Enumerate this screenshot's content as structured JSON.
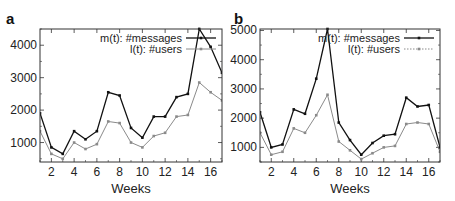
{
  "chart_data": [
    {
      "type": "line",
      "panel_label": "a",
      "title": "",
      "xlabel": "Weeks",
      "ylabel": "",
      "x": [
        1,
        2,
        3,
        4,
        5,
        6,
        7,
        8,
        9,
        10,
        11,
        12,
        13,
        14,
        15,
        16,
        17
      ],
      "xticks": [
        2,
        4,
        6,
        8,
        10,
        12,
        14,
        16
      ],
      "yticks": [
        1000,
        2000,
        3000,
        4000
      ],
      "xlim": [
        1,
        17
      ],
      "ylim": [
        400,
        4500
      ],
      "grid": false,
      "legend_position": "upper right",
      "series": [
        {
          "name": "m(t): #messages",
          "color": "#111111",
          "style": "solid",
          "values": [
            1900,
            850,
            650,
            1350,
            1100,
            1350,
            2550,
            2450,
            1450,
            1150,
            1800,
            1800,
            2400,
            2500,
            4500,
            3950,
            3150
          ]
        },
        {
          "name": "l(t): #users",
          "color": "#8a8a8a",
          "style": "solid",
          "values": [
            1350,
            650,
            500,
            1000,
            800,
            950,
            1650,
            1600,
            1000,
            850,
            1200,
            1300,
            1800,
            1850,
            2850,
            2550,
            2300
          ]
        }
      ]
    },
    {
      "type": "line",
      "panel_label": "b",
      "title": "",
      "xlabel": "Weeks",
      "ylabel": "",
      "x": [
        1,
        2,
        3,
        4,
        5,
        6,
        7,
        8,
        9,
        10,
        11,
        12,
        13,
        14,
        15,
        16,
        17
      ],
      "xticks": [
        2,
        4,
        6,
        8,
        10,
        12,
        14,
        16
      ],
      "yticks": [
        1000,
        2000,
        3000,
        4000,
        5000
      ],
      "xlim": [
        1,
        17
      ],
      "ylim": [
        500,
        5050
      ],
      "grid": false,
      "legend_position": "upper right",
      "series": [
        {
          "name": "m(t): #messages",
          "color": "#111111",
          "style": "solid",
          "values": [
            2200,
            1000,
            1100,
            2300,
            2150,
            3350,
            5050,
            1850,
            1250,
            750,
            1150,
            1400,
            1450,
            2700,
            2400,
            2450,
            1000
          ]
        },
        {
          "name": "l(t): #users",
          "color": "#8a8a8a",
          "style": "dotted",
          "values": [
            1500,
            750,
            850,
            1650,
            1500,
            2100,
            2800,
            1200,
            900,
            600,
            800,
            1000,
            1050,
            1800,
            1850,
            1800,
            850
          ]
        }
      ]
    }
  ]
}
